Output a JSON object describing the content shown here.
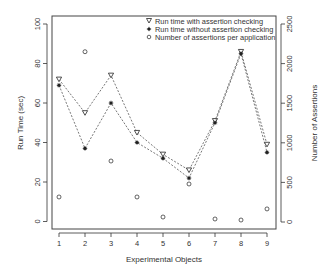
{
  "chart_data": {
    "type": "line",
    "title": "",
    "xlabel": "Experimental Objects",
    "ylabel": "Run Time (sec)",
    "y2label": "Number of Assertions",
    "x": [
      1,
      2,
      3,
      4,
      5,
      6,
      7,
      8,
      9
    ],
    "xticks": [
      "1",
      "2",
      "3",
      "4",
      "5",
      "6",
      "7",
      "8",
      "9"
    ],
    "ylim": [
      0,
      100
    ],
    "yticks": [
      "0",
      "20",
      "40",
      "60",
      "80",
      "100"
    ],
    "y2lim": [
      0,
      2500
    ],
    "y2ticks": [
      "0",
      "500",
      "1000",
      "1500",
      "2000",
      "2500"
    ],
    "grid": false,
    "legend_position": "top-right inside",
    "series": [
      {
        "name": "Run time with assertion checking",
        "marker": "triangle-down",
        "line": "dashed",
        "axis": "left",
        "values": [
          72,
          55,
          74,
          45,
          34,
          26,
          51,
          86,
          39
        ]
      },
      {
        "name": "Run time without assertion checking",
        "marker": "asterisk",
        "line": "dashed",
        "axis": "left",
        "values": [
          69,
          37,
          60,
          40,
          32,
          22,
          50,
          85,
          35
        ]
      },
      {
        "name": "Number of assertions per application",
        "marker": "circle",
        "line": "none",
        "axis": "right",
        "values": [
          316,
          2150,
          770,
          316,
          63,
          480,
          38,
          25,
          165
        ]
      }
    ]
  },
  "legend": {
    "items": [
      "Run time with assertion checking",
      "Run time without assertion checking",
      "Number of assertions per application"
    ]
  },
  "colors": {
    "axis": "#333333",
    "series": "#222222"
  }
}
